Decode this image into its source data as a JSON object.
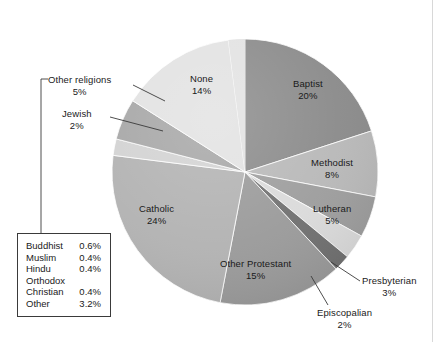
{
  "chart_data": {
    "type": "pie",
    "title": "",
    "subtitle": "",
    "xlabel": "",
    "ylabel": "",
    "unit": "percent",
    "legend_position": "inside-and-callouts",
    "grid": false,
    "start_angle_deg": 0,
    "direction": "clockwise",
    "categories": [
      "Baptist",
      "Methodist",
      "Lutheran",
      "Presbyterian",
      "Episcopalian",
      "Other Protestant",
      "Catholic",
      "Jewish",
      "Other religions",
      "None"
    ],
    "values": [
      20,
      8,
      5,
      3,
      2,
      15,
      24,
      2,
      5,
      14
    ],
    "labels": [
      "20%",
      "8%",
      "5%",
      "3%",
      "2%",
      "15%",
      "24%",
      "2%",
      "5%",
      "14%"
    ],
    "slice_colors": [
      "#8a8a8a",
      "#b8b8b8",
      "#9d9d9d",
      "#dadada",
      "#707070",
      "#9a9a9a",
      "#b2b2b2",
      "#d2d2d2",
      "#a6a6a6",
      "#e2e2e2"
    ],
    "other_religions_breakdown": {
      "rows": [
        {
          "name": "Buddhist",
          "value": "0.6%"
        },
        {
          "name": "Muslim",
          "value": "0.4%"
        },
        {
          "name": "Hindu",
          "value": "0.4%"
        },
        {
          "name": "Orthodox",
          "value": ""
        },
        {
          "name": "Christian",
          "value": "0.4%"
        },
        {
          "name": "Other",
          "value": "3.2%"
        }
      ]
    }
  },
  "slices": {
    "baptist": {
      "name": "Baptist",
      "pct": "20%"
    },
    "methodist": {
      "name": "Methodist",
      "pct": "8%"
    },
    "lutheran": {
      "name": "Lutheran",
      "pct": "5%"
    },
    "presbyterian": {
      "name": "Presbyterian",
      "pct": "3%"
    },
    "episcopalian": {
      "name": "Episcopalian",
      "pct": "2%"
    },
    "other_protestant": {
      "name": "Other Protestant",
      "pct": "15%"
    },
    "catholic": {
      "name": "Catholic",
      "pct": "24%"
    },
    "jewish": {
      "name": "Jewish",
      "pct": "2%"
    },
    "other_religions": {
      "name": "Other religions",
      "pct": "5%"
    },
    "none": {
      "name": "None",
      "pct": "14%"
    }
  },
  "legend": {
    "rows": [
      {
        "name": "Buddhist",
        "value": "0.6%"
      },
      {
        "name": "Muslim",
        "value": "0.4%"
      },
      {
        "name": "Hindu",
        "value": "0.4%"
      },
      {
        "name": "Orthodox",
        "value": ""
      },
      {
        "name": "Christian",
        "value": "0.4%"
      },
      {
        "name": "Other",
        "value": "3.2%"
      }
    ]
  },
  "colors": {
    "text": "#1a1a1a",
    "legend_border": "#3a3a3a",
    "leader_line": "#3a3a3a",
    "background": "#ffffff",
    "gutter_rule": "#d8d8d8"
  }
}
